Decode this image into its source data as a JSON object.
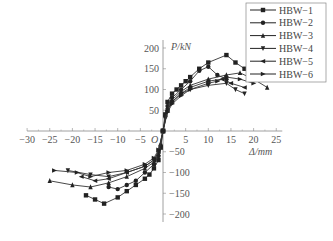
{
  "chart_data": {
    "type": "line",
    "title": "",
    "xlabel": "Δ/mm",
    "ylabel": "P/kN",
    "origin_label": "O",
    "xlim": [
      -30,
      25
    ],
    "ylim": [
      -200,
      200
    ],
    "x_ticks": [
      -30,
      -25,
      -20,
      -15,
      -10,
      -5,
      5,
      10,
      15,
      20,
      25
    ],
    "y_ticks": [
      200,
      150,
      100,
      50,
      -50,
      -100,
      -150,
      -200
    ],
    "grid": false,
    "legend_position": "upper right",
    "series": [
      {
        "name": "HBW-1",
        "marker": "square",
        "points": [
          [
            0,
            0
          ],
          [
            0.5,
            40
          ],
          [
            1,
            70
          ],
          [
            2,
            90
          ],
          [
            3,
            100
          ],
          [
            4,
            110
          ],
          [
            5,
            120
          ],
          [
            6,
            130
          ],
          [
            8,
            150
          ],
          [
            10,
            165
          ],
          [
            14,
            183
          ],
          [
            16,
            165
          ],
          [
            18,
            150
          ],
          [
            -0.5,
            -40
          ],
          [
            -1,
            -70
          ],
          [
            -2,
            -90
          ],
          [
            -3,
            -105
          ],
          [
            -4,
            -115
          ],
          [
            -6,
            -130
          ],
          [
            -8,
            -145
          ],
          [
            -10,
            -160
          ],
          [
            -13,
            -175
          ],
          [
            -15,
            -165
          ],
          [
            -17,
            -155
          ]
        ]
      },
      {
        "name": "HBW-2",
        "marker": "circle",
        "points": [
          [
            0,
            0
          ],
          [
            0.5,
            35
          ],
          [
            1,
            60
          ],
          [
            2,
            80
          ],
          [
            4,
            100
          ],
          [
            6,
            120
          ],
          [
            8,
            145
          ],
          [
            10,
            155
          ],
          [
            12,
            135
          ],
          [
            14,
            125
          ],
          [
            -0.5,
            -35
          ],
          [
            -1,
            -60
          ],
          [
            -2,
            -80
          ],
          [
            -4,
            -100
          ],
          [
            -6,
            -120
          ],
          [
            -8,
            -130
          ],
          [
            -10,
            -140
          ],
          [
            -12,
            -135
          ]
        ]
      },
      {
        "name": "HBW-3",
        "marker": "triangle-up",
        "points": [
          [
            0,
            0
          ],
          [
            1,
            55
          ],
          [
            2,
            75
          ],
          [
            4,
            95
          ],
          [
            6,
            110
          ],
          [
            10,
            125
          ],
          [
            14,
            135
          ],
          [
            17,
            140
          ],
          [
            20,
            125
          ],
          [
            23,
            105
          ],
          [
            -1,
            -55
          ],
          [
            -2,
            -75
          ],
          [
            -4,
            -90
          ],
          [
            -8,
            -110
          ],
          [
            -12,
            -125
          ],
          [
            -16,
            -135
          ],
          [
            -20,
            -130
          ],
          [
            -25,
            -120
          ]
        ]
      },
      {
        "name": "HBW-4",
        "marker": "triangle-down",
        "points": [
          [
            0,
            0
          ],
          [
            1,
            50
          ],
          [
            2,
            70
          ],
          [
            4,
            90
          ],
          [
            6,
            100
          ],
          [
            10,
            110
          ],
          [
            14,
            115
          ],
          [
            16,
            100
          ],
          [
            18,
            90
          ],
          [
            -1,
            -50
          ],
          [
            -2,
            -70
          ],
          [
            -4,
            -85
          ],
          [
            -8,
            -100
          ],
          [
            -12,
            -110
          ],
          [
            -16,
            -105
          ],
          [
            -21,
            -95
          ]
        ]
      },
      {
        "name": "HBW-5",
        "marker": "triangle-left",
        "points": [
          [
            0,
            0
          ],
          [
            1,
            50
          ],
          [
            2,
            70
          ],
          [
            4,
            90
          ],
          [
            6,
            105
          ],
          [
            10,
            120
          ],
          [
            13,
            125
          ],
          [
            15,
            115
          ],
          [
            18,
            105
          ],
          [
            -1,
            -50
          ],
          [
            -2,
            -70
          ],
          [
            -4,
            -85
          ],
          [
            -8,
            -100
          ],
          [
            -12,
            -115
          ],
          [
            -15,
            -120
          ],
          [
            -18,
            -110
          ]
        ]
      },
      {
        "name": "HBW-6",
        "marker": "triangle-right",
        "points": [
          [
            0,
            0
          ],
          [
            1,
            45
          ],
          [
            2,
            65
          ],
          [
            4,
            85
          ],
          [
            6,
            100
          ],
          [
            10,
            115
          ],
          [
            12,
            120
          ],
          [
            14,
            130
          ],
          [
            17,
            125
          ],
          [
            20,
            115
          ],
          [
            -1,
            -45
          ],
          [
            -2,
            -65
          ],
          [
            -4,
            -80
          ],
          [
            -8,
            -95
          ],
          [
            -12,
            -100
          ],
          [
            -16,
            -110
          ],
          [
            -19,
            -100
          ],
          [
            -24,
            -95
          ]
        ]
      }
    ]
  }
}
